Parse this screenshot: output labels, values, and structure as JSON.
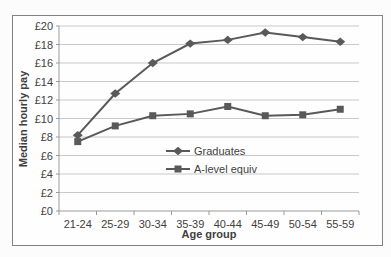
{
  "figure": {
    "background": "#fefefe",
    "border_color": "#828282"
  },
  "chart_data": {
    "type": "line",
    "title": "",
    "xlabel": "Age group",
    "ylabel": "Median hourly pay",
    "categories": [
      "21-24",
      "25-29",
      "30-34",
      "35-39",
      "40-44",
      "45-49",
      "50-54",
      "55-59"
    ],
    "series": [
      {
        "name": "Graduates",
        "marker": "diamond",
        "color": "#595959",
        "values": [
          8.2,
          12.7,
          16.0,
          18.1,
          18.5,
          19.3,
          18.8,
          18.3
        ]
      },
      {
        "name": "A-level equiv",
        "marker": "square",
        "color": "#595959",
        "values": [
          7.5,
          9.2,
          10.3,
          10.5,
          11.3,
          10.3,
          10.4,
          11.0
        ]
      }
    ],
    "y_axis": {
      "min": 0,
      "max": 20,
      "step": 2,
      "tick_labels": [
        "£0",
        "£2",
        "£4",
        "£6",
        "£8",
        "£10",
        "£12",
        "£14",
        "£16",
        "£18",
        "£20"
      ]
    },
    "ylim": [
      0,
      20
    ],
    "grid": true,
    "legend_position": "inside-center-right",
    "colors": {
      "gridline": "#c9c9c9",
      "axis": "#9b9b9b",
      "text": "#3f3f3f"
    }
  }
}
